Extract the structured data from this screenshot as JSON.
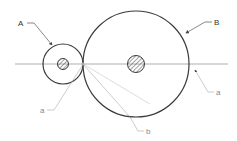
{
  "diagram": {
    "type": "two tangent circles (gears/pulleys) on a common center line",
    "labels": {
      "A": "A",
      "B": "B",
      "a_left": "a",
      "a_right": "a",
      "b": "b"
    },
    "colors": {
      "circle": "#3a3a3a",
      "centerline": "#9a9a9a",
      "leader": "#8a8a8a",
      "label_dark": "#333333",
      "label_light": "#888888"
    }
  }
}
